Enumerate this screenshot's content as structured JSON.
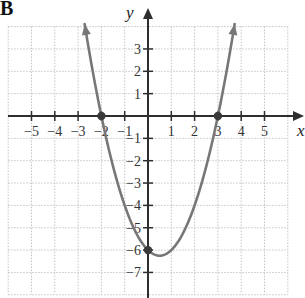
{
  "panel_label": "B",
  "colors": {
    "axis": "#2e2e2e",
    "grid": "#c4c4c4",
    "curve": "#777777",
    "point": "#3a3a3a",
    "text": "#333333"
  },
  "chart_data": {
    "type": "line",
    "title": "",
    "panel_label": "B",
    "xlabel": "x",
    "ylabel": "y",
    "xlim": [
      -6,
      6
    ],
    "ylim": [
      -8,
      4
    ],
    "grid": true,
    "grid_style": "dotted",
    "x_ticks": [
      -5,
      -4,
      -3,
      -2,
      -1,
      1,
      2,
      3,
      4,
      5
    ],
    "x_tick_labels": [
      "−5",
      "−4",
      "−3",
      "−2",
      "−1",
      "1",
      "2",
      "3",
      "4",
      "5"
    ],
    "y_ticks": [
      3,
      2,
      1,
      -1,
      -2,
      -3,
      -4,
      -5,
      -6,
      -7
    ],
    "y_tick_labels": [
      "3",
      "2",
      "1",
      "−1",
      "−2",
      "−3",
      "−4",
      "−5",
      "−6",
      "−7"
    ],
    "series": [
      {
        "name": "y = x² − x − 6",
        "equation": "y = x^2 - x - 6",
        "x_range": [
          -2.72,
          3.72
        ],
        "arrows_at_ends": true,
        "vertex": [
          0.5,
          -6.25
        ]
      }
    ],
    "points": [
      {
        "label": "x-intercept",
        "x": -2,
        "y": 0
      },
      {
        "label": "x-intercept",
        "x": 3,
        "y": 0
      },
      {
        "label": "y-intercept",
        "x": 0,
        "y": -6
      }
    ]
  }
}
